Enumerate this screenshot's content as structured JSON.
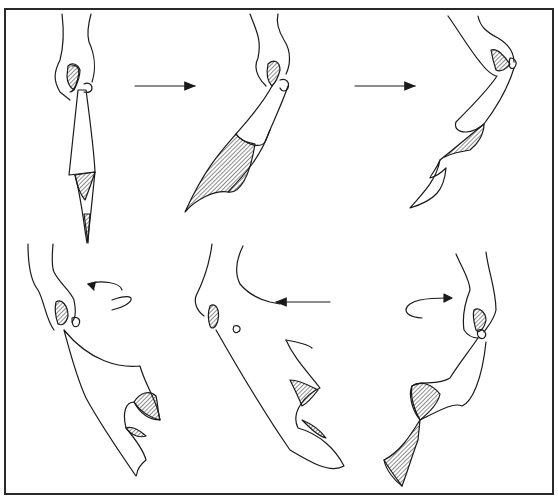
{
  "figure": {
    "panels": [
      {
        "id": 1,
        "row": 1,
        "col": 1,
        "label": "hand holds cloth hanging straight down"
      },
      {
        "id": 2,
        "row": 1,
        "col": 2,
        "label": "cloth swings to the left"
      },
      {
        "id": 3,
        "row": 1,
        "col": 3,
        "label": "wrist raised, cloth twists"
      },
      {
        "id": 4,
        "row": 2,
        "col": 1,
        "label": "cloth billows outward with curl"
      },
      {
        "id": 5,
        "row": 2,
        "col": 2,
        "label": "cloth waves, moving left"
      },
      {
        "id": 6,
        "row": 2,
        "col": 3,
        "label": "cloth twists in spiral"
      }
    ],
    "arrows": [
      {
        "id": "a1",
        "type": "straight",
        "direction": "right",
        "between": [
          1,
          2
        ]
      },
      {
        "id": "a2",
        "type": "straight",
        "direction": "right",
        "between": [
          2,
          3
        ]
      },
      {
        "id": "a3",
        "type": "curved",
        "direction": "left",
        "panel": 4
      },
      {
        "id": "a4",
        "type": "straight",
        "direction": "left",
        "panel": 5
      },
      {
        "id": "a5",
        "type": "curved",
        "direction": "right",
        "panel": 6
      }
    ],
    "colors": {
      "line": "#1a1a1a",
      "border": "#2a2a2a",
      "background": "#ffffff"
    }
  }
}
